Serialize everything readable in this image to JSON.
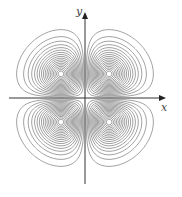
{
  "chart_data": {
    "type": "contour",
    "title": "",
    "function_hint": "f(x,y) = x*y*exp(-(x^2+y^2)) (four-lobed saddle contour map)",
    "xlabel": "x",
    "ylabel": "y",
    "axes": {
      "arrows": true,
      "ticks": false,
      "grid": false
    },
    "lobes": [
      {
        "quadrant": "I",
        "sign": "+"
      },
      {
        "quadrant": "II",
        "sign": "-"
      },
      {
        "quadrant": "III",
        "sign": "+"
      },
      {
        "quadrant": "IV",
        "sign": "-"
      }
    ],
    "levels_per_lobe": 18,
    "colors": {
      "contour": "#7a7a7a",
      "axis": "#333333",
      "dense_shading": "#9a9a9a"
    }
  },
  "labels": {
    "x": "x",
    "y": "y"
  }
}
